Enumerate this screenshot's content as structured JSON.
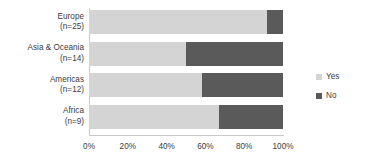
{
  "chart_data": {
    "type": "bar",
    "orientation": "horizontal",
    "stacked": true,
    "stacked_normalized": true,
    "title": "",
    "xlabel": "",
    "ylabel": "",
    "grid": false,
    "legend_position": "right",
    "xlim": [
      0,
      100
    ],
    "categories": [
      "Europe",
      "Asia & Oceania",
      "Americas",
      "Africa"
    ],
    "category_sublabels": [
      "(n=25)",
      "(n=14)",
      "(n=12)",
      "(n=9)"
    ],
    "category_counts": [
      25,
      14,
      12,
      9
    ],
    "tick_labels": [
      "0%",
      "20%",
      "40%",
      "60%",
      "80%",
      "100%"
    ],
    "tick_values": [
      0,
      20,
      40,
      60,
      80,
      100
    ],
    "series": [
      {
        "name": "Yes",
        "color": "#d4d4d4",
        "values": [
          92,
          50,
          58,
          67
        ]
      },
      {
        "name": "No",
        "color": "#5a5a5a",
        "values": [
          8,
          50,
          42,
          33
        ]
      }
    ]
  },
  "legend": {
    "items": [
      {
        "label": "Yes",
        "color": "#d4d4d4"
      },
      {
        "label": "No",
        "color": "#5a5a5a"
      }
    ]
  },
  "colors": {
    "yes": "#d4d4d4",
    "no": "#5a5a5a",
    "axis": "#c9c9c9",
    "text": "#3c3c3c",
    "background": "#ffffff"
  }
}
